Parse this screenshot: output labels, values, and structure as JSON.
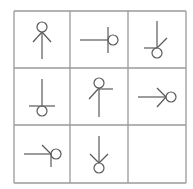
{
  "puzzle": {
    "type": "3x3 symbol matrix",
    "rows": 3,
    "cols": 3,
    "grid": {
      "x": [
        14,
        70,
        128,
        186
      ],
      "y": [
        11,
        68,
        125,
        183
      ],
      "line_color": "#9a9a9a"
    },
    "glyph_color": "#5a5a5a",
    "cells": [
      {
        "row": 1,
        "col": 1,
        "description": "circle on top, vertical stem, V-arrow pointing up at circle",
        "circle": [
          42,
          27,
          5
        ],
        "lines": [
          [
            42,
            32,
            42,
            59
          ],
          [
            42,
            32,
            33,
            42
          ],
          [
            42,
            32,
            51,
            42
          ]
        ]
      },
      {
        "row": 1,
        "col": 2,
        "description": "horizontal stem to right, perpendicular bar, circle on right",
        "circle": [
          113,
          40,
          5
        ],
        "lines": [
          [
            80,
            40,
            108,
            40
          ],
          [
            108,
            27,
            108,
            53
          ]
        ]
      },
      {
        "row": 1,
        "col": 3,
        "description": "vertical stem down, circle at bottom, left half-bar and upper-right diagonal at joint",
        "circle": [
          157,
          53,
          5
        ],
        "lines": [
          [
            157,
            21,
            157,
            48
          ],
          [
            144,
            48,
            157,
            48
          ],
          [
            157,
            48,
            167,
            38
          ]
        ]
      },
      {
        "row": 2,
        "col": 1,
        "description": "vertical stem down, full horizontal bar, circle at bottom",
        "circle": [
          42,
          111,
          5
        ],
        "lines": [
          [
            42,
            79,
            42,
            106
          ],
          [
            29,
            106,
            55,
            106
          ]
        ]
      },
      {
        "row": 2,
        "col": 2,
        "description": "circle on top, vertical stem, right half-bar and lower-left diagonal at joint",
        "circle": [
          99,
          83,
          5
        ],
        "lines": [
          [
            99,
            88,
            99,
            117
          ],
          [
            99,
            89,
            113,
            89
          ],
          [
            99,
            88,
            89,
            99
          ]
        ]
      },
      {
        "row": 2,
        "col": 3,
        "description": "horizontal stem to right, V-arrow pointing right at circle",
        "circle": [
          171,
          97,
          5
        ],
        "lines": [
          [
            138,
            97,
            166,
            97
          ],
          [
            166,
            97,
            157,
            88
          ],
          [
            166,
            97,
            157,
            107
          ]
        ]
      },
      {
        "row": 3,
        "col": 1,
        "description": "horizontal stem to right, circle on right, lower half-bar and upper-left diagonal at joint",
        "circle": [
          56,
          154,
          5
        ],
        "lines": [
          [
            24,
            154,
            51,
            154
          ],
          [
            51,
            154,
            51,
            167
          ],
          [
            51,
            154,
            42,
            145
          ]
        ]
      },
      {
        "row": 3,
        "col": 2,
        "description": "vertical stem down, V-arrow pointing down at circle",
        "circle": [
          99,
          168,
          5
        ],
        "lines": [
          [
            99,
            136,
            99,
            163
          ],
          [
            99,
            163,
            90,
            154
          ],
          [
            99,
            163,
            108,
            154
          ]
        ]
      },
      {
        "row": 3,
        "col": 3,
        "description": "empty (missing answer cell)",
        "circle": null,
        "lines": []
      }
    ]
  }
}
